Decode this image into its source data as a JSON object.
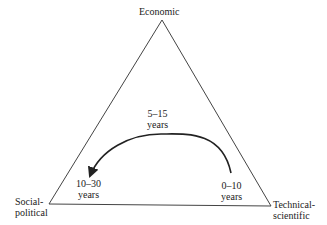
{
  "diagram": {
    "type": "triangle-cycle",
    "vertices": {
      "top": {
        "label": "Economic"
      },
      "bottom_left": {
        "label_line1": "Social-",
        "label_line2": "political"
      },
      "bottom_right": {
        "label_line1": "Technical-",
        "label_line2": "scientific"
      }
    },
    "durations": {
      "technical": {
        "line1": "0–10",
        "line2": "years"
      },
      "economic": {
        "line1": "5–15",
        "line2": "years"
      },
      "social": {
        "line1": "10–30",
        "line2": "years"
      }
    },
    "arrow": {
      "from": "Technical-scientific",
      "to": "Social-political",
      "via": "Economic",
      "direction": "counter-clockwise"
    },
    "colors": {
      "stroke": "#333333",
      "text": "#222222",
      "background": "#ffffff"
    }
  }
}
